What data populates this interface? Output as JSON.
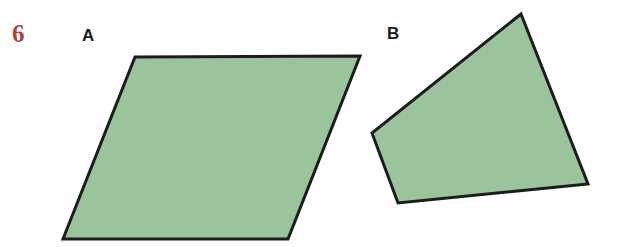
{
  "page": {
    "background_color": "#fefefe",
    "width": 618,
    "height": 247
  },
  "exercise": {
    "number": "6",
    "number_color": "#a8453a"
  },
  "labels": {
    "shape_a": "A",
    "shape_b": "B",
    "label_color": "#1b1b1b"
  },
  "style": {
    "fill_color": "#9cc49c",
    "stroke_color": "#1c1c1c",
    "stroke_width": 3
  },
  "shapes": [
    {
      "id": "shape-a",
      "label": "A",
      "kind": "parallelogram",
      "points": "135,57 360,56 288,239 63,239",
      "fill": "#9cc49c",
      "stroke": "#1c1c1c",
      "stroke_width": 3
    },
    {
      "id": "shape-b",
      "label": "B",
      "kind": "quadrilateral",
      "points": "521,14 588,184 398,203 372,133",
      "fill": "#9cc49c",
      "stroke": "#1c1c1c",
      "stroke_width": 3
    }
  ]
}
